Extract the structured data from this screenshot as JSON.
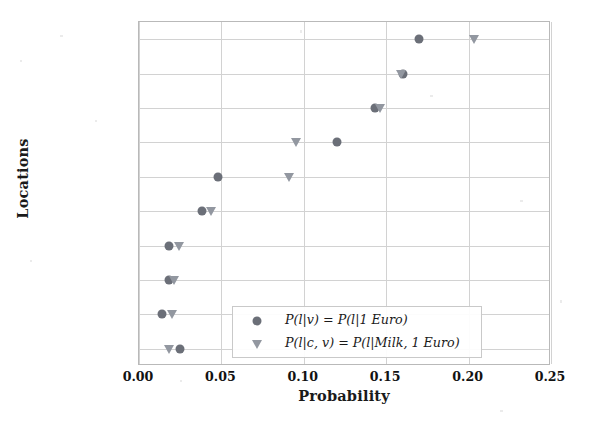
{
  "chart_data": {
    "type": "scatter",
    "title": "",
    "xlabel": "Probability",
    "ylabel": "Locations",
    "xlim": [
      0.0,
      0.25
    ],
    "xticks": [
      "0.00",
      "0.05",
      "0.10",
      "0.15",
      "0.20",
      "0.25"
    ],
    "xtick_values": [
      0.0,
      0.05,
      0.1,
      0.15,
      0.2,
      0.25
    ],
    "categories": [
      "France",
      "Germany",
      "Italy",
      "Spain",
      "China",
      "Netherlands",
      "Vietnam",
      "Belgium",
      "Austria",
      "Greece"
    ],
    "grid": true,
    "legend_position": "lower right",
    "series": [
      {
        "name": "P(l|v) = P(l|1 Euro)",
        "marker": "circle",
        "color": "#6b6f78",
        "values": [
          0.17,
          0.16,
          0.143,
          0.12,
          0.048,
          0.038,
          0.018,
          0.0185,
          0.014,
          0.025
        ]
      },
      {
        "name": "P(l|c, v) = P(l|Milk, 1 Euro)",
        "marker": "triangle-down",
        "color": "#9297a0",
        "values": [
          0.203,
          0.159,
          0.146,
          0.0955,
          0.091,
          0.0435,
          0.0245,
          0.021,
          0.02,
          0.018
        ]
      }
    ]
  },
  "legend": {
    "entries": [
      {
        "symbol": "circle-marker",
        "label": "P(l|v) = P(l|1 Euro)"
      },
      {
        "symbol": "triangle-down-marker",
        "label": "P(l|c, v) = P(l|Milk, 1 Euro)"
      }
    ]
  },
  "axes": {
    "x_title": "Probability",
    "y_title": "Locations"
  }
}
